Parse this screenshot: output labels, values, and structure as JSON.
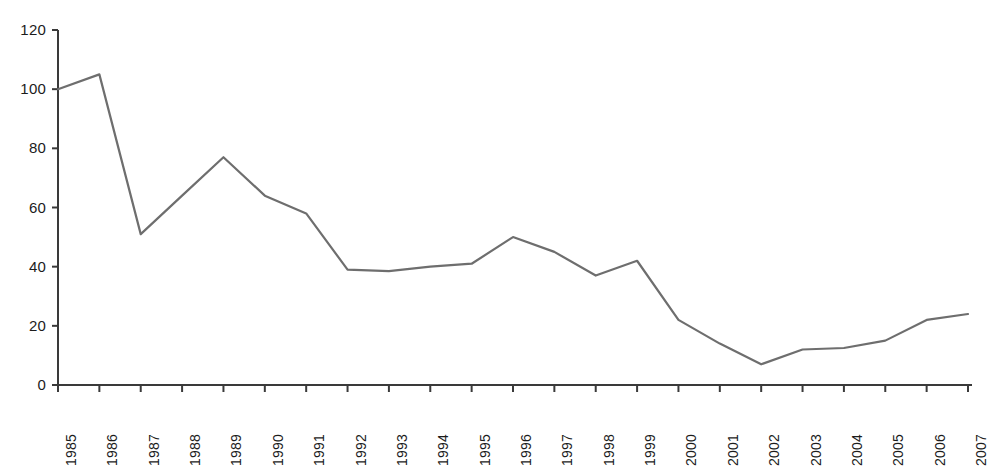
{
  "chart_data": {
    "type": "line",
    "title": "",
    "subtitle": "",
    "xlabel": "",
    "ylabel": "",
    "categories": [
      "1985",
      "1986",
      "1987",
      "1988",
      "1989",
      "1990",
      "1991",
      "1992",
      "1993",
      "1994",
      "1995",
      "1996",
      "1997",
      "1998",
      "1999",
      "2000",
      "2001",
      "2002",
      "2003",
      "2004",
      "2005",
      "2006",
      "2007"
    ],
    "values": [
      100,
      105,
      51,
      64,
      77,
      64,
      58,
      39,
      38.5,
      40,
      41,
      50,
      45,
      37,
      42,
      22,
      14,
      7,
      12,
      12.5,
      15,
      22,
      24
    ],
    "series": [
      {
        "name": "series-1",
        "values": [
          100,
          105,
          51,
          64,
          77,
          64,
          58,
          39,
          38.5,
          40,
          41,
          50,
          45,
          37,
          42,
          22,
          14,
          7,
          12,
          12.5,
          15,
          22,
          24
        ]
      }
    ],
    "ylim": [
      0,
      120
    ],
    "yticks": [
      0,
      20,
      40,
      60,
      80,
      100,
      120
    ],
    "ytick_labels": [
      "0",
      "20",
      "40",
      "60",
      "80",
      "100",
      "120"
    ],
    "xlim": [
      "1985",
      "2007"
    ],
    "grid": false,
    "legend": "none",
    "line_color": "#6e6e6e",
    "axis_color": "#3a3a3a",
    "text_color": "#1c1c1c",
    "background": "#ffffff"
  },
  "axes": {
    "y_axis_name": "y-axis",
    "x_axis_name": "x-axis"
  }
}
